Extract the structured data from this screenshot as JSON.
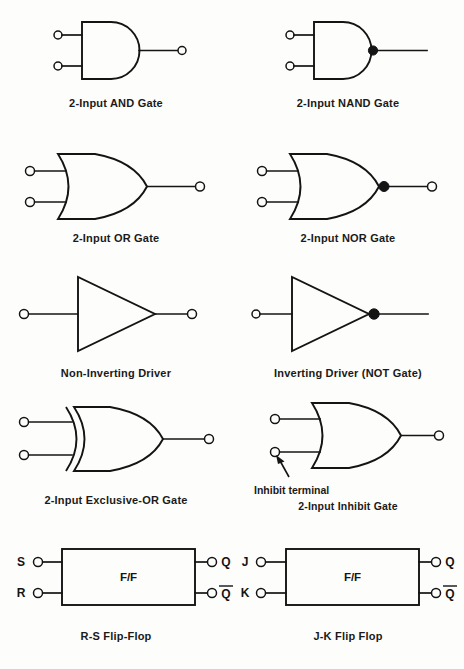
{
  "sheet": {
    "title": "Digital Logic Symbols Reference",
    "background_color": "#fdfdfb",
    "line_color": "#141414",
    "columns": 2,
    "rows": 5
  },
  "symbols": [
    {
      "id": "and-gate",
      "caption": "2-Input AND Gate",
      "shape": "and",
      "inputs": 2,
      "inverted_output": false,
      "output_terminal": true
    },
    {
      "id": "nand-gate",
      "caption": "2-Input NAND Gate",
      "shape": "and",
      "inputs": 2,
      "inverted_output": true,
      "output_terminal": false
    },
    {
      "id": "or-gate",
      "caption": "2-Input OR Gate",
      "shape": "or",
      "inputs": 2,
      "inverted_output": false,
      "output_terminal": true
    },
    {
      "id": "nor-gate",
      "caption": "2-Input NOR Gate",
      "shape": "or",
      "inputs": 2,
      "inverted_output": true,
      "output_terminal": true
    },
    {
      "id": "non-inverting-driver",
      "caption": "Non-Inverting Driver",
      "shape": "buffer",
      "inputs": 1,
      "inverted_output": false,
      "output_terminal": true
    },
    {
      "id": "inverting-driver",
      "caption": "Inverting Driver (NOT Gate)",
      "shape": "buffer",
      "inputs": 1,
      "inverted_output": true,
      "output_terminal": false
    },
    {
      "id": "exclusive-or-gate",
      "caption": "2-Input Exclusive-OR Gate",
      "shape": "xor",
      "inputs": 2,
      "inverted_output": false,
      "output_terminal": true
    },
    {
      "id": "inhibit-gate",
      "caption": "2-Input Inhibit Gate",
      "annotation": "Inhibit terminal",
      "shape": "or",
      "inputs": 2,
      "inverted_output": false,
      "output_terminal": true
    }
  ],
  "flipflops": [
    {
      "id": "rs-flip-flop",
      "caption": "R-S Flip-Flop",
      "body_label": "F/F",
      "inputs": [
        "S",
        "R"
      ],
      "outputs": [
        "Q",
        "Q"
      ],
      "output_overbar": [
        false,
        true
      ]
    },
    {
      "id": "jk-flip-flop",
      "caption": "J-K Flip Flop",
      "body_label": "F/F",
      "inputs": [
        "J",
        "K"
      ],
      "outputs": [
        "Q",
        "Q"
      ],
      "output_overbar": [
        false,
        true
      ]
    }
  ]
}
